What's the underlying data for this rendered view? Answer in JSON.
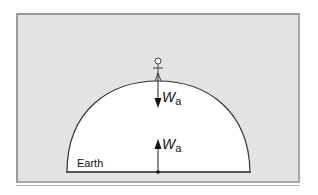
{
  "diagram": {
    "body_label": "Earth",
    "force_top": {
      "symbol": "W",
      "subscript": "a",
      "direction": "down"
    },
    "force_bottom": {
      "symbol": "W",
      "subscript": "a",
      "direction": "up"
    },
    "figure": "person-standing-on-top",
    "colors": {
      "background": "#e3e3e3",
      "earth": "#ffffff",
      "outline": "#333333"
    }
  }
}
